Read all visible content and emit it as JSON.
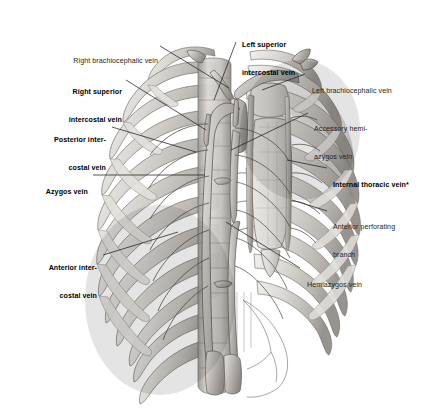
{
  "figure": {
    "type": "anatomical-illustration",
    "background_color": "#ffffff",
    "ink_color": "#231f20",
    "bone_fill": "#d8d6d2",
    "bone_shade": "#a9a6a1",
    "vessel_fill": "#b9b6b1"
  },
  "labels": {
    "right_brachiocephalic_vein": {
      "text": "Right brachiocephalic vein",
      "bold": false,
      "side": "left",
      "lines": [
        "Right brachiocephalic vein"
      ]
    },
    "right_superior_intercostal_vein": {
      "text": "Right superior intercostal vein",
      "bold": true,
      "side": "left",
      "lines": [
        "Right superior",
        "intercostal vein"
      ]
    },
    "posterior_intercostal_vein": {
      "text": "Posterior intercostal vein",
      "bold": true,
      "side": "left",
      "lines": [
        "Posterior inter-",
        "costal vein"
      ]
    },
    "azygos_vein": {
      "text": "Azygos vein",
      "bold": true,
      "side": "left",
      "lines": [
        "Azygos vein"
      ]
    },
    "anterior_intercostal_vein": {
      "text": "Anterior intercostal vein",
      "bold": true,
      "side": "left",
      "lines": [
        "Anterior inter-",
        "costal vein"
      ]
    },
    "left_superior_intercostal_vein": {
      "text": "Left superior intercostal vein",
      "bold": true,
      "side": "top",
      "lines": [
        "Left superior",
        "intercostal vein"
      ]
    },
    "left_brachiocephalic_vein": {
      "text": "Left brachiocephalic vein",
      "bold": false,
      "side": "right",
      "lines": [
        "Left brachiocephalic vein"
      ]
    },
    "accessory_hemiazygos_vein": {
      "text": "Accessory hemi-azygos vein",
      "bold": false,
      "side": "right",
      "lines": [
        "Accessory hemi-",
        "azygos vein"
      ]
    },
    "internal_thoracic_vein": {
      "text": "Internal thoracic vein*",
      "bold": true,
      "side": "right",
      "lines": [
        "Internal thoracic vein*"
      ]
    },
    "anterior_perforating_branch": {
      "text": "Anterior perforating branch",
      "bold": false,
      "side": "right",
      "lines": [
        "Anterior perforating",
        "branch"
      ]
    },
    "hemiazygos_vein": {
      "text": "Hemiazygos vein",
      "bold": false,
      "side": "right",
      "lines": [
        "Hemiazygos vein"
      ]
    }
  }
}
